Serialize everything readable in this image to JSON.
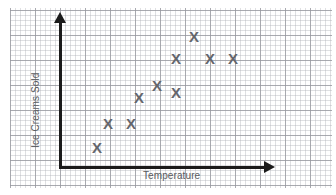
{
  "chart": {
    "type": "scatter",
    "title": "",
    "xlabel": "Temperature",
    "ylabel": "Ice Creams Sold",
    "marker_glyph": "X",
    "marker_color": "#64666c",
    "grid": true,
    "grid_minor_px": 5,
    "grid_major_px": 25,
    "axis_color": "#1b1b1b",
    "grid_minor_color": "#b2b4ba",
    "grid_major_color": "#96989e",
    "background_color": "#ffffff"
  },
  "chart_data": {
    "type": "scatter",
    "title": "",
    "xlabel": "Temperature",
    "ylabel": "Ice Creams Sold",
    "grid": true,
    "legend": "none",
    "axis_ticks": "none",
    "xlim": [
      0,
      10
    ],
    "ylim": [
      0,
      10
    ],
    "series": [
      {
        "name": "Ice cream sales vs temperature",
        "marker": "X",
        "color": "#64666c",
        "points": [
          {
            "x": 1.8,
            "y": 1.3,
            "px": 97,
            "py": 147
          },
          {
            "x": 2.3,
            "y": 2.9,
            "px": 108,
            "py": 123
          },
          {
            "x": 3.4,
            "y": 2.9,
            "px": 131,
            "py": 123
          },
          {
            "x": 3.8,
            "y": 4.6,
            "px": 139,
            "py": 97
          },
          {
            "x": 4.7,
            "y": 5.4,
            "px": 157,
            "py": 85
          },
          {
            "x": 5.6,
            "y": 7.2,
            "px": 176,
            "py": 58
          },
          {
            "x": 5.6,
            "y": 4.9,
            "px": 176,
            "py": 92
          },
          {
            "x": 6.5,
            "y": 8.7,
            "px": 194,
            "py": 36
          },
          {
            "x": 7.3,
            "y": 7.2,
            "px": 210,
            "py": 58
          },
          {
            "x": 8.4,
            "y": 7.2,
            "px": 233,
            "py": 58
          }
        ]
      }
    ],
    "correlation": "positive"
  }
}
